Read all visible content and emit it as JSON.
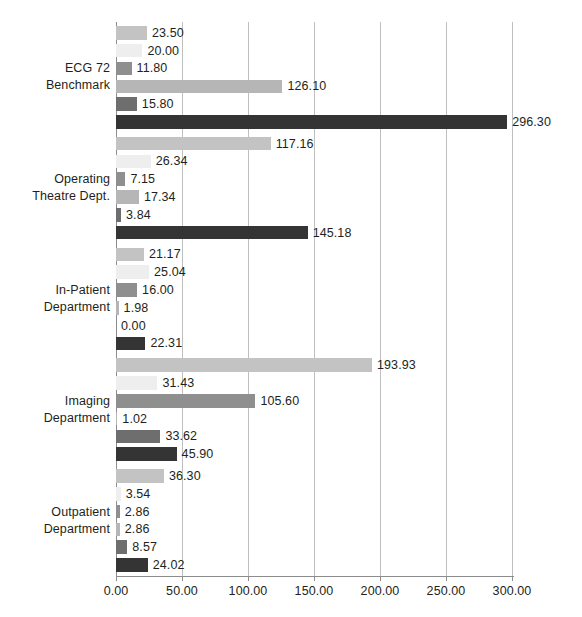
{
  "chart_data": {
    "type": "bar",
    "orientation": "horizontal",
    "title": "",
    "xlabel": "",
    "ylabel": "",
    "xlim": [
      0,
      301.5
    ],
    "xticks": [
      0,
      50,
      100,
      150,
      200,
      250,
      300
    ],
    "xtick_labels": [
      "0.00",
      "50.00",
      "100.00",
      "150.00",
      "200.00",
      "250.00",
      "300.00"
    ],
    "grid": true,
    "legend": "none",
    "value_label_format": "0.00",
    "categories": [
      "ECG 72 Benchmark",
      "Operating Theatre Dept.",
      "In-Patient Department",
      "Imaging Department",
      "Outpatient Department"
    ],
    "category_lines": [
      [
        "ECG 72",
        "Benchmark"
      ],
      [
        "Operating",
        "Theatre Dept."
      ],
      [
        "In-Patient",
        "Department"
      ],
      [
        "Imaging",
        "Department"
      ],
      [
        "Outpatient",
        "Department"
      ]
    ],
    "series": [
      {
        "name": "Series 1",
        "color": "#c3c3c3",
        "values": [
          23.5,
          117.16,
          21.17,
          193.93,
          36.3
        ],
        "labels": [
          "23.50",
          "117.16",
          "21.17",
          "193.93",
          "36.30"
        ]
      },
      {
        "name": "Series 2",
        "color": "#eeeeee",
        "values": [
          20.0,
          26.34,
          25.04,
          31.43,
          3.54
        ],
        "labels": [
          "20.00",
          "26.34",
          "25.04",
          "31.43",
          "3.54"
        ]
      },
      {
        "name": "Series 3",
        "color": "#8f8f8f",
        "values": [
          11.8,
          7.15,
          16.0,
          105.6,
          2.86
        ],
        "labels": [
          "11.80",
          "7.15",
          "16.00",
          "105.60",
          "2.86"
        ]
      },
      {
        "name": "Series 4",
        "color": "#b6b6b6",
        "values": [
          126.1,
          17.34,
          1.98,
          1.02,
          2.86
        ],
        "labels": [
          "126.10",
          "17.34",
          "1.98",
          "1.02",
          "2.86"
        ]
      },
      {
        "name": "Series 5",
        "color": "#6e6e6e",
        "values": [
          15.8,
          3.84,
          0.0,
          33.62,
          8.57
        ],
        "labels": [
          "15.80",
          "3.84",
          "0.00",
          "33.62",
          "8.57"
        ]
      },
      {
        "name": "Series 6",
        "color": "#343434",
        "values": [
          296.3,
          145.18,
          22.31,
          45.9,
          24.02
        ],
        "labels": [
          "296.30",
          "145.18",
          "22.31",
          "45.90",
          "24.02"
        ]
      }
    ]
  }
}
